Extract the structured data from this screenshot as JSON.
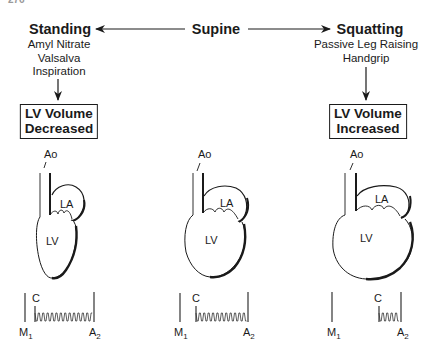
{
  "page_number": "276",
  "positions": {
    "left": {
      "title": "Standing",
      "interventions": [
        "Amyl Nitrate",
        "Valsalva",
        "Inspiration"
      ],
      "result": [
        "LV Volume",
        "Decreased"
      ]
    },
    "center": {
      "title": "Supine"
    },
    "right": {
      "title": "Squatting",
      "interventions": [
        "Passive Leg Raising",
        "Handgrip"
      ],
      "result": [
        "LV Volume",
        "Increased"
      ]
    }
  },
  "heart_labels": {
    "aorta": "Ao",
    "left_atrium": "LA",
    "left_ventricle": "LV"
  },
  "phono_labels": {
    "click": "C",
    "m1": "M",
    "m1_sub": "1",
    "a2": "A",
    "a2_sub": "2"
  },
  "colors": {
    "ink": "#1a1a1a",
    "background": "#ffffff"
  }
}
